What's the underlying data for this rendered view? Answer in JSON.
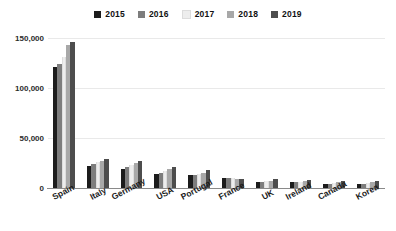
{
  "chart_data": {
    "type": "bar",
    "title": "",
    "xlabel": "",
    "ylabel": "",
    "ylim": [
      0,
      150000
    ],
    "yticks": [
      "0",
      "50,000",
      "100,000",
      "150,000"
    ],
    "ytick_values": [
      0,
      50000,
      100000,
      150000
    ],
    "grid": true,
    "legend_position": "top-center",
    "categories": [
      "Spain",
      "Italy",
      "Germany",
      "USA",
      "Portugal",
      "France",
      "UK",
      "Ireland",
      "Canada",
      "Korea"
    ],
    "series": [
      {
        "name": "2015",
        "color": "#1c1c1c",
        "values": [
          121000,
          22000,
          19000,
          14000,
          13000,
          10500,
          6000,
          6000,
          4000,
          3800
        ]
      },
      {
        "name": "2016",
        "color": "#7d7d7d",
        "values": [
          124000,
          24500,
          21000,
          15500,
          13500,
          10000,
          6200,
          6200,
          4500,
          4200
        ]
      },
      {
        "name": "2017",
        "color": "#ededed",
        "values": [
          131000,
          26500,
          23500,
          17500,
          14500,
          9800,
          7000,
          6500,
          5200,
          5000
        ]
      },
      {
        "name": "2018",
        "color": "#a8a8a8",
        "values": [
          143000,
          27000,
          25500,
          19000,
          15500,
          9500,
          7500,
          7000,
          6000,
          6200
        ]
      },
      {
        "name": "2019",
        "color": "#4d4d4d",
        "values": [
          146000,
          29000,
          27000,
          21000,
          18000,
          9200,
          8800,
          8200,
          7500,
          7200
        ]
      }
    ]
  },
  "legend": {
    "items": [
      {
        "label": "2015"
      },
      {
        "label": "2016"
      },
      {
        "label": "2017"
      },
      {
        "label": "2018"
      },
      {
        "label": "2019"
      }
    ]
  }
}
